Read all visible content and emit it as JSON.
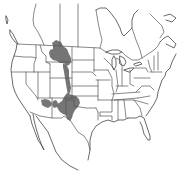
{
  "map": {
    "type": "species-range-map",
    "region": "North America (southern Canada, United States, northern Mexico)",
    "background_color": "#ffffff",
    "border_color": "#555555",
    "range_color": "#6e6e6e",
    "labels": [],
    "range_areas": [
      {
        "name": "northern-range",
        "approx_states": [
          "Montana",
          "Wyoming",
          "southern Alberta/Saskatchewan border"
        ]
      },
      {
        "name": "central-corridor",
        "approx_states": [
          "Colorado",
          "western Nebraska",
          "western Kansas"
        ]
      },
      {
        "name": "southern-range",
        "approx_states": [
          "Arizona",
          "New Mexico",
          "western Texas/Oklahoma panhandle"
        ]
      }
    ]
  }
}
